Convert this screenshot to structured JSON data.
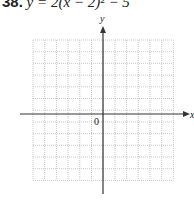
{
  "problem": {
    "number": "38.",
    "equation": "y = 2(x − 2)² − 5"
  },
  "graph": {
    "x_axis_label": "x",
    "y_axis_label": "y",
    "origin_label": "0",
    "grid": {
      "columns": 12,
      "rows": 12,
      "left": 33,
      "top": 40,
      "cell": 11.7
    },
    "colors": {
      "grid": "#bbbbbb",
      "axis": "#333333"
    }
  }
}
